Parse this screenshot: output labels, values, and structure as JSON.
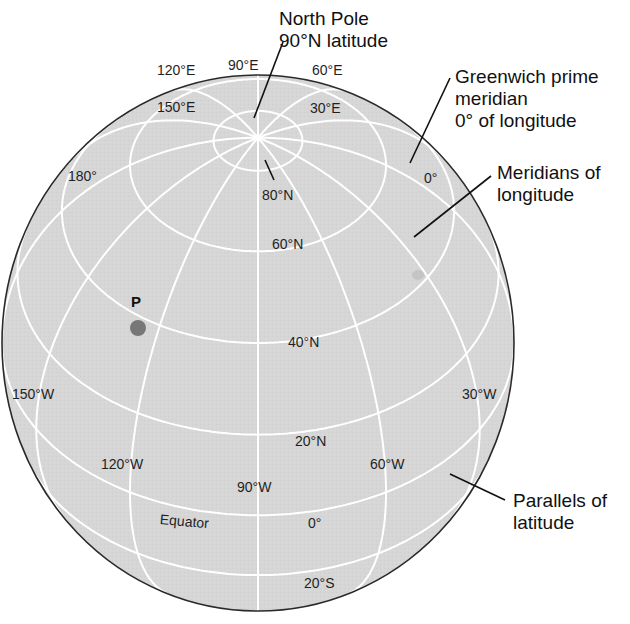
{
  "figure": {
    "colors": {
      "globe_fill": "#d6d6d6",
      "grid_line": "#ffffff",
      "outline": "#2a2a2a",
      "point": "#777777",
      "leader": "#111111"
    }
  },
  "graticule": {
    "central_meridian_deg": -90,
    "view_tilt_deg": 40,
    "meridians_deg": [
      0,
      30,
      60,
      90,
      120,
      150,
      180,
      -150,
      -120,
      -90,
      -60,
      -30
    ],
    "parallels_deg": [
      80,
      60,
      40,
      20,
      0,
      -20
    ]
  },
  "callouts": {
    "north_pole": [
      "North Pole",
      "90°N latitude"
    ],
    "greenwich": [
      "Greenwich prime",
      "meridian",
      "0° of longitude"
    ],
    "meridians": [
      "Meridians of",
      "longitude"
    ],
    "parallels": [
      "Parallels of",
      "latitude"
    ]
  },
  "labels": {
    "lon_120E": "120°E",
    "lon_90E": "90°E",
    "lon_60E": "60°E",
    "lon_150E": "150°E",
    "lon_30E": "30°E",
    "lon_180": "180°",
    "lon_0": "0°",
    "lat_80N": "80°N",
    "lat_60N": "60°N",
    "lat_40N": "40°N",
    "lat_20N": "20°N",
    "lat_0": "0°",
    "lat_20S": "20°S",
    "equator": "Equator",
    "lon_150W": "150°W",
    "lon_120W": "120°W",
    "lon_90W": "90°W",
    "lon_60W": "60°W",
    "lon_30W": "30°W"
  },
  "point": {
    "label": "P",
    "latitude_deg": 40,
    "longitude_deg": -140
  }
}
